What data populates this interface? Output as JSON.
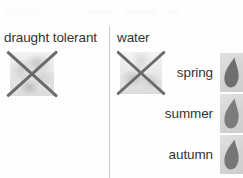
{
  "legend": {
    "columns": [
      {
        "key": "draught_tolerant",
        "label": "draught tolerant",
        "icon": "plant-photo-icon",
        "crossed_out": true,
        "cross_icon": "cross-out-icon"
      },
      {
        "key": "water",
        "label": "water",
        "icon": "watering-photo-icon",
        "crossed_out": true,
        "cross_icon": "cross-out-icon"
      }
    ],
    "seasons": [
      {
        "label": "spring",
        "icon": "water-droplet-icon",
        "droplet_color": "#6f6f6f",
        "tile_color": "#d6d6d6"
      },
      {
        "label": "summer",
        "icon": "water-droplet-icon",
        "droplet_color": "#7c7c7c",
        "tile_color": "#d6d6d6"
      },
      {
        "label": "autumn",
        "icon": "water-droplet-icon",
        "droplet_color": "#767676",
        "tile_color": "#d6d6d6"
      }
    ],
    "colors": {
      "background": "#fefefe",
      "text": "#333333",
      "divider": "#c9c9c9",
      "cross_stroke": "#6b6b6b",
      "photo_tile": "#e4e4e4"
    }
  }
}
